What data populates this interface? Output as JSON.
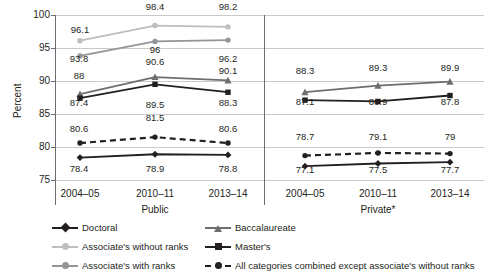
{
  "chart_data": {
    "type": "line",
    "title": "",
    "xlabel": "",
    "ylabel": "Percent",
    "ylim": [
      75,
      100
    ],
    "yticks": [
      75,
      80,
      85,
      90,
      95,
      100
    ],
    "grid": true,
    "legend_position": "bottom",
    "panels": [
      {
        "name": "Public",
        "categories": [
          "2004–05",
          "2010–11",
          "2013–14"
        ]
      },
      {
        "name": "Private*",
        "categories": [
          "2004–05",
          "2010–11",
          "2013–14"
        ]
      }
    ],
    "series": [
      {
        "name": "Doctoral",
        "color": "#231f20",
        "marker": "diamond",
        "dash": false,
        "panels": {
          "Public": [
            78.4,
            78.9,
            78.8
          ],
          "Private*": [
            77.1,
            77.5,
            77.7
          ]
        }
      },
      {
        "name": "Baccalaureate",
        "color": "#6d6e71",
        "marker": "triangle",
        "dash": false,
        "panels": {
          "Public": [
            88,
            90.6,
            90.1
          ],
          "Private*": [
            88.3,
            89.3,
            89.9
          ]
        }
      },
      {
        "name": "Associate's without ranks",
        "color": "#bcbec0",
        "marker": "circle",
        "dash": false,
        "panels": {
          "Public": [
            96.1,
            98.4,
            98.2
          ],
          "Private*": []
        }
      },
      {
        "name": "Master's",
        "color": "#231f20",
        "marker": "square",
        "dash": false,
        "panels": {
          "Public": [
            87.4,
            89.5,
            88.3
          ],
          "Private*": [
            87.1,
            86.9,
            87.8
          ]
        }
      },
      {
        "name": "Associate's with ranks",
        "color": "#939598",
        "marker": "circle",
        "dash": false,
        "panels": {
          "Public": [
            93.8,
            96,
            96.2
          ],
          "Private*": []
        }
      },
      {
        "name": "All categories combined except associate's without ranks",
        "color": "#231f20",
        "marker": "circle",
        "dash": true,
        "panels": {
          "Public": [
            80.6,
            81.5,
            80.6
          ],
          "Private*": [
            78.7,
            79.1,
            79
          ]
        }
      }
    ]
  },
  "axis": {
    "ylabel": "Percent",
    "ytick_labels": [
      "100",
      "95",
      "90",
      "85",
      "80",
      "75"
    ],
    "public_xticks": [
      "2004–05",
      "2010–11",
      "2013–14"
    ],
    "private_xticks": [
      "2004–05",
      "2010–11",
      "2013–14"
    ],
    "public_label": "Public",
    "private_label": "Private*"
  },
  "data_labels": {
    "public": {
      "assoc_without": [
        "96.1",
        "98.4",
        "98.2"
      ],
      "assoc_with": [
        "93.8",
        "96",
        "96.2"
      ],
      "bacc": [
        "88",
        "90.6",
        "90.1"
      ],
      "masters": [
        "87.4",
        "89.5",
        "88.3"
      ],
      "combined": [
        "80.6",
        "81.5",
        "80.6"
      ],
      "doctoral": [
        "78.4",
        "78.9",
        "78.8"
      ]
    },
    "private": {
      "bacc": [
        "88.3",
        "89.3",
        "89.9"
      ],
      "masters": [
        "87.1",
        "86.9",
        "87.8"
      ],
      "combined": [
        "78.7",
        "79.1",
        "79"
      ],
      "doctoral": [
        "77.1",
        "77.5",
        "77.7"
      ]
    }
  },
  "legend": {
    "items": [
      {
        "label": "Doctoral",
        "color": "#231f20",
        "marker": "diamond",
        "dash": false
      },
      {
        "label": "Baccalaureate",
        "color": "#6d6e71",
        "marker": "triangle",
        "dash": false
      },
      {
        "label": "Associate's without ranks",
        "color": "#bcbec0",
        "marker": "circle",
        "dash": false
      },
      {
        "label": "Master's",
        "color": "#231f20",
        "marker": "square",
        "dash": false
      },
      {
        "label": "Associate's with ranks",
        "color": "#939598",
        "marker": "circle",
        "dash": false
      },
      {
        "label": "All categories combined except associate's without ranks",
        "color": "#231f20",
        "marker": "circle",
        "dash": true
      }
    ]
  }
}
